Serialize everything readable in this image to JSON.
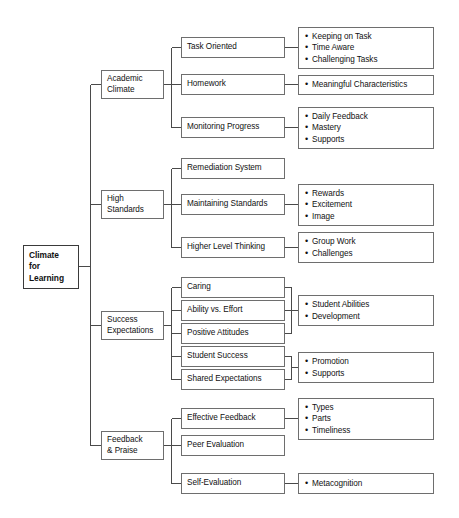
{
  "diagram": {
    "title": "Climate for Learning",
    "root": {
      "label": "Climate\nfor\nLearning"
    },
    "branches": [
      {
        "label": "Academic\nClimate",
        "children": [
          {
            "label": "Task Oriented",
            "details": [
              "Keeping on Task",
              "Time Aware",
              "Challenging Tasks"
            ]
          },
          {
            "label": "Homework",
            "details": [
              "Meaningful Characteristics"
            ]
          },
          {
            "label": "Monitoring Progress",
            "details": [
              "Daily Feedback",
              "Mastery",
              "Supports"
            ]
          }
        ]
      },
      {
        "label": "High\nStandards",
        "children": [
          {
            "label": "Remediation System",
            "details": []
          },
          {
            "label": "Maintaining Standards",
            "details": [
              "Rewards",
              "Excitement",
              "Image"
            ]
          },
          {
            "label": "Higher Level Thinking",
            "details": [
              "Group Work",
              "Challenges"
            ]
          }
        ]
      },
      {
        "label": "Success\nExpectations",
        "children": [
          {
            "label": "Caring",
            "details": []
          },
          {
            "label": "Ability vs. Effort",
            "details": []
          },
          {
            "label": "Positive Attitudes",
            "details": []
          },
          {
            "label": "Student Success",
            "details": []
          },
          {
            "label": "Shared Expectations",
            "details": []
          }
        ],
        "grouped_details": [
          {
            "members": [
              "Caring",
              "Ability vs. Effort",
              "Positive Attitudes"
            ],
            "details": [
              "Student Abilities",
              "Development"
            ]
          },
          {
            "members": [
              "Student Success",
              "Shared Expectations"
            ],
            "details": [
              "Promotion",
              "Supports"
            ]
          }
        ]
      },
      {
        "label": "Feedback\n& Praise",
        "children": [
          {
            "label": "Effective Feedback",
            "details": [
              "Types",
              "Parts",
              "Timeliness"
            ]
          },
          {
            "label": "Peer Evaluation",
            "details": []
          },
          {
            "label": "Self-Evaluation",
            "details": [
              "Metacognition"
            ]
          }
        ]
      }
    ],
    "colors": {
      "box_border": "#6e6e6e",
      "root_border": "#3a3a3a",
      "line": "#4a4a4a",
      "text": "#111111",
      "background": "#ffffff"
    }
  }
}
